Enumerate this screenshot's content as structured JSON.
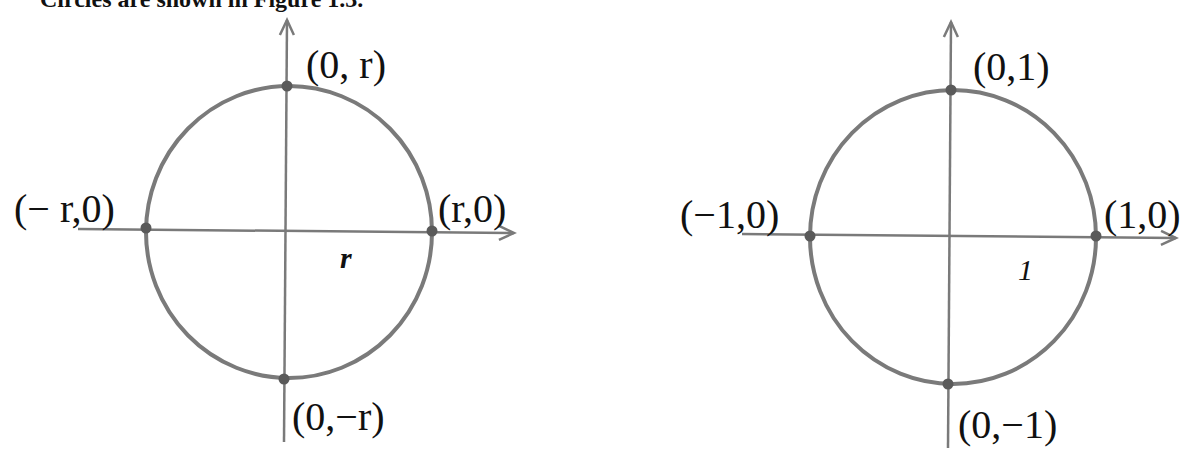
{
  "caption": {
    "text": "Circles are shown in Figure 1.3."
  },
  "colors": {
    "stroke": "#7a7a7a",
    "point": "#5a5a5a",
    "text": "#111111"
  },
  "left_diagram": {
    "title": "circle of radius r",
    "labels": {
      "top": "(0, r)",
      "bottom": "(0,−r)",
      "left": "(− r,0)",
      "right": "(r,0)",
      "radius": "r"
    }
  },
  "right_diagram": {
    "title": "unit circle",
    "labels": {
      "top": "(0,1)",
      "bottom": "(0,−1)",
      "left": "(−1,0)",
      "right": "(1,0)",
      "radius": "1"
    }
  }
}
